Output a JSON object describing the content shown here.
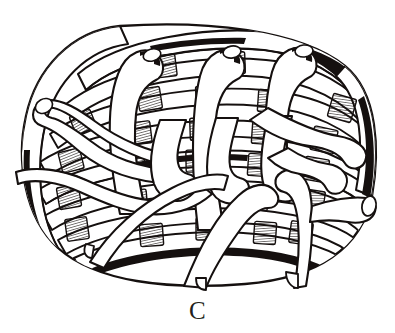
{
  "figure": {
    "caption_label": "C",
    "medium": "pen-and-ink line illustration",
    "background_color": "#ffffff",
    "ink_color": "#15100f",
    "view": "three-quarter top-side view of an oval coiled/plaited basket"
  },
  "illustration": {
    "title": "Woven splint basket",
    "body": {
      "name": "basket-body",
      "outline_shape": "rounded oval barrel",
      "bounds": {
        "x": 18,
        "y": 24,
        "width": 360,
        "height": 262
      }
    },
    "weave": {
      "horizontal_splint_count": 9,
      "vertical_strap_count": 8,
      "rim_loops": 3,
      "hatched_joint_count": 26,
      "notes": "flat splints woven over vertical uprights; shaded hatch blocks mark the over/under crossings"
    },
    "elements": [
      {
        "name": "top-rim-splint",
        "kind": "rim",
        "shading": "stippled"
      },
      {
        "name": "bottom-rim-splint",
        "kind": "rim",
        "shading": "stippled-and-solid"
      },
      {
        "name": "left-side-coil",
        "kind": "side",
        "shading": "hatched"
      },
      {
        "name": "right-side-coil",
        "kind": "side",
        "shading": "hatched"
      },
      {
        "name": "cut-strap-end",
        "kind": "detail",
        "shading": "outline"
      }
    ]
  }
}
